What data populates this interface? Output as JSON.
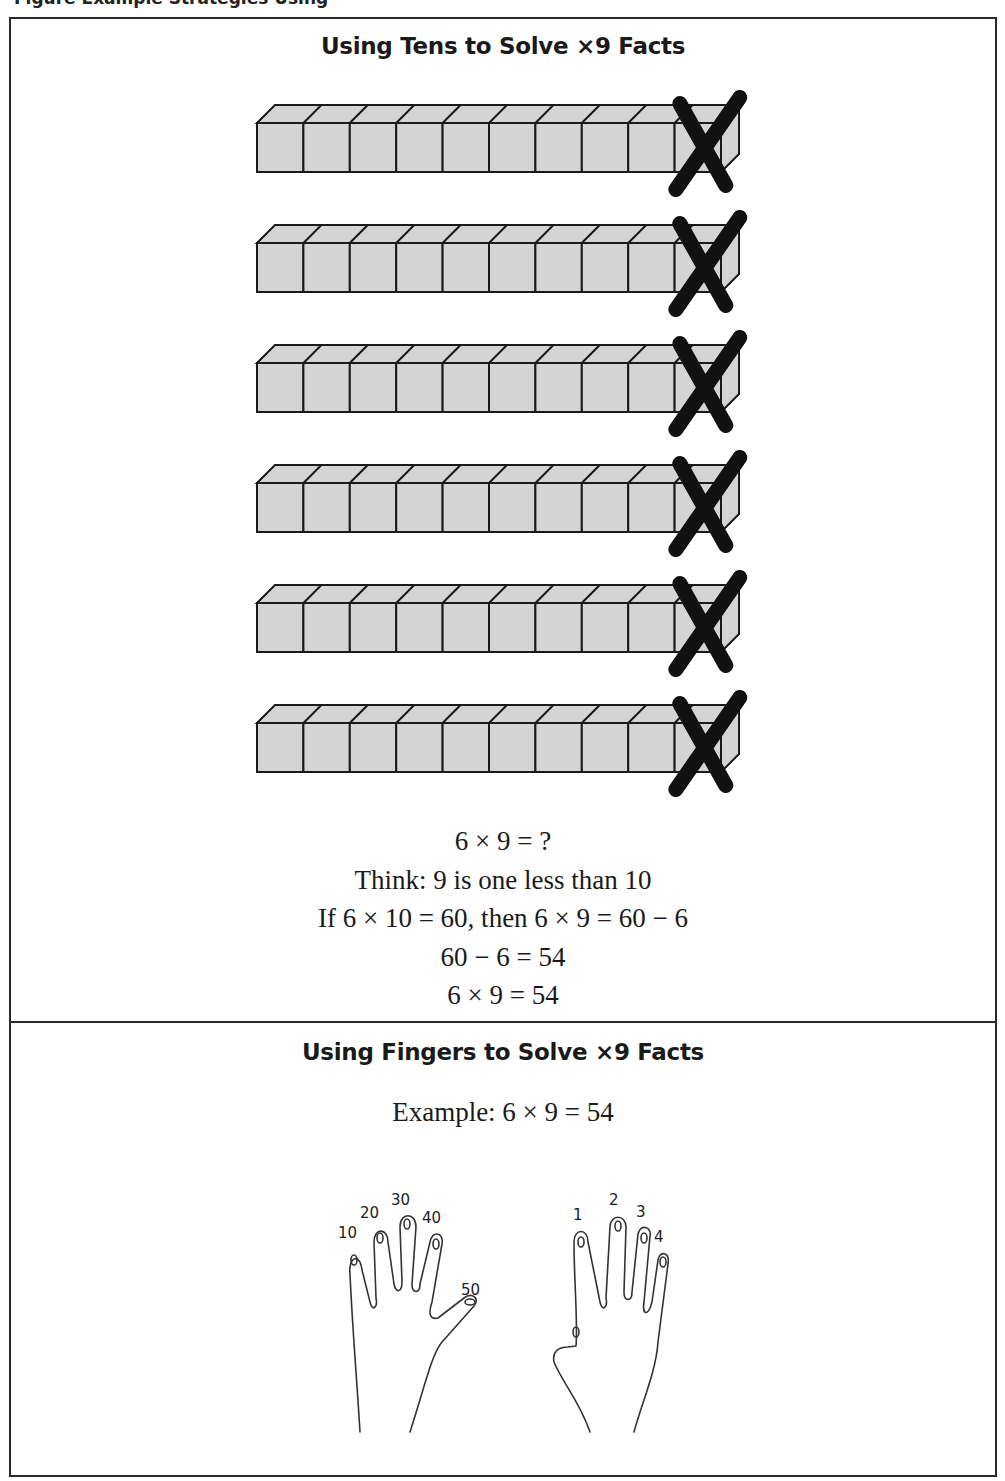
{
  "caption": "Figure  Example Strategies  Using",
  "tens_section": {
    "heading": "Using Tens to Solve ×9 Facts",
    "rods": {
      "count": 6,
      "cubes_per_rod": 10,
      "crossed_cube": 10
    },
    "colors": {
      "cube_fill": "#d4d4d4",
      "stroke": "#1a1a1a",
      "cross": "#111111"
    },
    "lines": [
      "6 × 9 = ?",
      "Think: 9 is one less than 10",
      "If 6 × 10 = 60, then 6 × 9 = 60 − 6",
      "60 − 6 = 54",
      "6 × 9 = 54"
    ]
  },
  "fingers_section": {
    "heading": "Using Fingers to Solve ×9 Facts",
    "example": "Example: 6 × 9 = 54",
    "left_hand_labels": [
      "10",
      "20",
      "30",
      "40",
      "50"
    ],
    "right_hand_labels": [
      "1",
      "2",
      "3",
      "4"
    ]
  }
}
